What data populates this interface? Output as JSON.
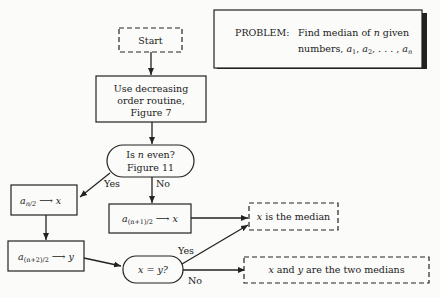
{
  "problem": {
    "label": "PROBLEM:",
    "line1": "Find median of n given",
    "line2": "numbers, a1, a2, . . . , an"
  },
  "nodes": {
    "start": "Start",
    "decreasing_line1": "Use decreasing",
    "decreasing_line2": "order routine,",
    "decreasing_line3": "Figure 7",
    "is_even_line1": "Is n even?",
    "is_even_line2": "Figure 11",
    "assign_x_even": "a_{n/2} → x",
    "assign_x_odd": "a_{(n+1)/2} → x",
    "assign_y": "a_{(n+2)/2} → y",
    "compare": "x = y?",
    "median": "x is the median",
    "two_medians": "x and y are the two medians"
  },
  "edges": {
    "yes1": "Yes",
    "no1": "No",
    "yes2": "Yes",
    "no2": "No"
  }
}
